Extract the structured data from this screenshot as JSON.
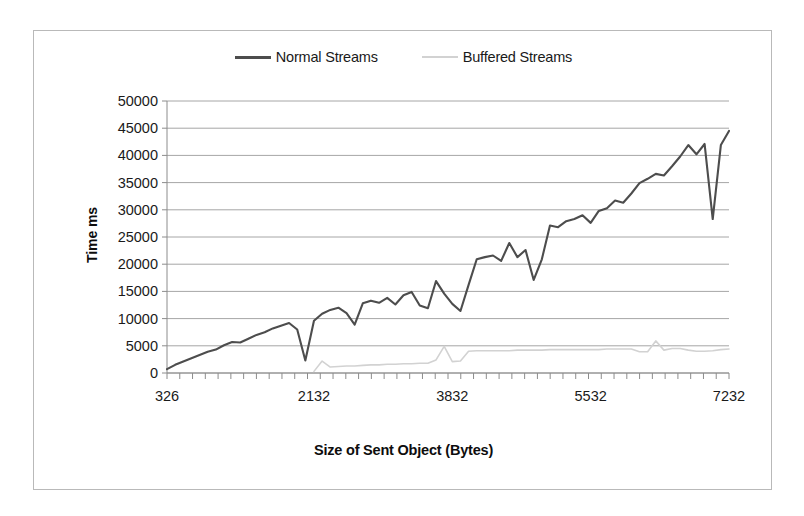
{
  "chart_data": {
    "type": "line",
    "title": "",
    "xlabel": "Size of Sent Object (Bytes)",
    "ylabel": "Time ms",
    "grid": true,
    "legend_position": "top-center",
    "xlim": [
      326,
      7232
    ],
    "ylim": [
      0,
      50000
    ],
    "y_ticks": [
      0,
      5000,
      10000,
      15000,
      20000,
      25000,
      30000,
      35000,
      40000,
      45000,
      50000
    ],
    "y_tick_labels": [
      "0",
      "5000",
      "10000",
      "15000",
      "20000",
      "25000",
      "30000",
      "35000",
      "40000",
      "45000",
      "50000"
    ],
    "x_ticks": [
      326,
      2132,
      3832,
      5532,
      7232
    ],
    "x_tick_labels": [
      "326",
      "2132",
      "3832",
      "5532",
      "7232"
    ],
    "x_minor_tick_count": 44,
    "colors": {
      "normal": "#4d4d4d",
      "buffered": "#d2d2d2",
      "grid": "#a6a6a6",
      "axis": "#8c8c8c",
      "border": "#b9b9b9"
    },
    "series": [
      {
        "name": "Normal Streams",
        "color": "#4d4d4d",
        "x": [
          326,
          426,
          526,
          626,
          726,
          826,
          926,
          1026,
          1126,
          1226,
          1326,
          1426,
          1526,
          1626,
          1726,
          1826,
          1926,
          2026,
          2132,
          2232,
          2332,
          2432,
          2532,
          2632,
          2732,
          2832,
          2932,
          3032,
          3132,
          3232,
          3332,
          3432,
          3532,
          3632,
          3732,
          3832,
          3932,
          4032,
          4132,
          4232,
          4332,
          4432,
          4532,
          4632,
          4732,
          4832,
          4932,
          5032,
          5132,
          5232,
          5332,
          5432,
          5532,
          5632,
          5732,
          5832,
          5932,
          6032,
          6132,
          6232,
          6332,
          6432,
          6532,
          6632,
          6732,
          6832,
          6932,
          7032,
          7132,
          7232
        ],
        "values": [
          700,
          1500,
          2100,
          2700,
          3300,
          3900,
          4300,
          5100,
          5700,
          5600,
          6300,
          7000,
          7500,
          8200,
          8700,
          9200,
          8000,
          2300,
          9600,
          10900,
          11600,
          12000,
          11000,
          8900,
          12800,
          13300,
          12900,
          13800,
          12600,
          14300,
          14900,
          12400,
          11900,
          16900,
          14600,
          12700,
          11400,
          16200,
          20900,
          21300,
          21600,
          20600,
          23900,
          21300,
          22600,
          17100,
          20900,
          27100,
          26800,
          27900,
          28300,
          29000,
          27600,
          29800,
          30300,
          31700,
          31300,
          33000,
          34900,
          35700,
          36600,
          36300,
          38000,
          39800,
          41900,
          40200,
          42100,
          28300,
          41900,
          44500
        ]
      },
      {
        "name": "Buffered Streams",
        "color": "#d2d2d2",
        "x": [
          2132,
          2232,
          2332,
          2432,
          2532,
          2632,
          2732,
          2832,
          2932,
          3032,
          3132,
          3232,
          3332,
          3432,
          3532,
          3632,
          3732,
          3832,
          3932,
          4032,
          4132,
          4232,
          4332,
          4432,
          4532,
          4632,
          4732,
          4832,
          4932,
          5032,
          5132,
          5232,
          5332,
          5432,
          5532,
          5632,
          5732,
          5832,
          5932,
          6032,
          6132,
          6232,
          6332,
          6432,
          6532,
          6632,
          6732,
          6832,
          6932,
          7032,
          7132,
          7232
        ],
        "values": [
          300,
          2200,
          1100,
          1200,
          1300,
          1300,
          1400,
          1500,
          1500,
          1600,
          1600,
          1700,
          1700,
          1800,
          1800,
          2400,
          4900,
          2100,
          2200,
          4000,
          4100,
          4100,
          4100,
          4100,
          4100,
          4200,
          4200,
          4200,
          4200,
          4300,
          4300,
          4300,
          4300,
          4300,
          4300,
          4300,
          4400,
          4400,
          4400,
          4400,
          3900,
          3900,
          5900,
          4200,
          4500,
          4500,
          4200,
          4000,
          4000,
          4100,
          4300,
          4400
        ]
      }
    ]
  },
  "legend": {
    "entries": [
      {
        "label": "Normal Streams",
        "swatch": "normal-line-swatch"
      },
      {
        "label": "Buffered Streams",
        "swatch": "buffered-line-swatch"
      }
    ]
  },
  "axes": {
    "y_title": "Time ms",
    "x_title": "Size of Sent Object (Bytes)"
  }
}
